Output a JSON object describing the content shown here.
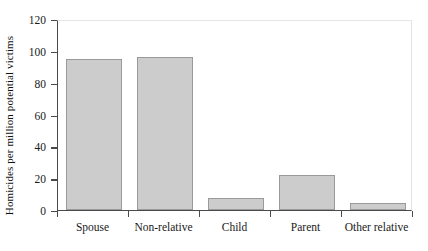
{
  "chart_data": {
    "type": "bar",
    "title": "",
    "xlabel": "",
    "ylabel": "Homicides per million potential victims",
    "categories": [
      "Spouse",
      "Non-relative",
      "Child",
      "Parent",
      "Other relative"
    ],
    "values": [
      95,
      96,
      7.5,
      22,
      4.5
    ],
    "ylim": [
      0,
      120
    ],
    "yticks": [
      0,
      20,
      40,
      60,
      80,
      100,
      120
    ],
    "ytick_labels": [
      "0",
      "20",
      "40",
      "60",
      "80",
      "100",
      "120"
    ],
    "grid": false,
    "legend": null,
    "bar_color": "#cccccc",
    "bar_border_color": "#9a9a9a",
    "axis_color": "#4a4a4a"
  }
}
